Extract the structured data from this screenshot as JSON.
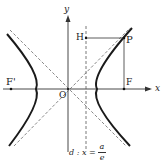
{
  "diagram": {
    "type": "hyperbola-focus-directrix",
    "labels": {
      "x_axis": "x",
      "y_axis": "y",
      "origin": "O",
      "focus": "F",
      "focus_prime": "F'",
      "point": "P",
      "foot": "H",
      "directrix_prefix": "d : x =",
      "directrix_num": "a",
      "directrix_den": "e"
    },
    "colors": {
      "curve": "#1a1a1a",
      "axis": "#333333",
      "dashed": "#555555"
    }
  }
}
